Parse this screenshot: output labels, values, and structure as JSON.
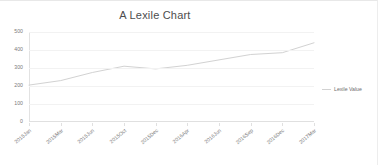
{
  "chart_data": {
    "type": "line",
    "title": "A Lexile Chart",
    "xlabel": "",
    "ylabel": "",
    "ylim": [
      0,
      500
    ],
    "grid": true,
    "legend_position": "right",
    "legend": [
      "Lexile Value"
    ],
    "categories": [
      "2015Jan",
      "2015Mar",
      "2015Jun",
      "2015Oct",
      "2015Dec",
      "2016Apr",
      "2016Jun",
      "2016Sep",
      "2016Dec",
      "2017Mar"
    ],
    "series": [
      {
        "name": "Lexile Value",
        "color": "#d2d2d2",
        "values": [
          205,
          230,
          275,
          310,
          295,
          315,
          345,
          375,
          385,
          440
        ]
      }
    ],
    "y_ticks": [
      0,
      100,
      200,
      300,
      400,
      500
    ]
  },
  "legend": {
    "swatch_name": "line-swatch",
    "label": "Lexile Value"
  }
}
